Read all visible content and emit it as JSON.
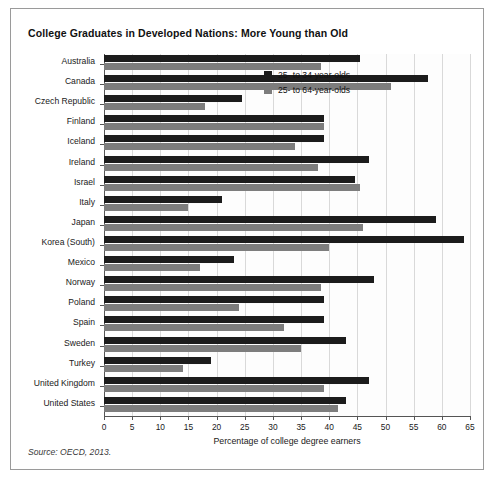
{
  "figure": {
    "source_note": "Source: OECD, 2013.",
    "colors": {
      "young": "#1c1c1c",
      "all": "#7d7d7d",
      "grid": "#d9d9d9",
      "axis": "#555555",
      "frame": "#9a9a9a"
    }
  },
  "chart_data": {
    "type": "bar",
    "orientation": "horizontal",
    "title": "College Graduates in Developed Nations: More Young than Old",
    "xlabel": "Percentage of college degree earners",
    "ylabel": "",
    "xlim": [
      0,
      65
    ],
    "xticks": [
      0,
      5,
      10,
      15,
      20,
      25,
      30,
      35,
      40,
      45,
      50,
      55,
      60,
      65
    ],
    "grid": true,
    "legend_position": "upper right inside",
    "categories": [
      "Australia",
      "Canada",
      "Czech Republic",
      "Finland",
      "Iceland",
      "Ireland",
      "Israel",
      "Italy",
      "Japan",
      "Korea (South)",
      "Mexico",
      "Norway",
      "Poland",
      "Spain",
      "Sweden",
      "Turkey",
      "United Kingdom",
      "United States"
    ],
    "series": [
      {
        "name": "25- to 34-year-olds",
        "color": "#1c1c1c",
        "values": [
          45.5,
          57.5,
          24.5,
          39,
          39,
          47,
          44.5,
          21,
          59,
          64,
          23,
          48,
          39,
          39,
          43,
          19,
          47,
          43
        ]
      },
      {
        "name": "25- to 64-year-olds",
        "color": "#7d7d7d",
        "values": [
          38.5,
          51,
          18,
          39,
          34,
          38,
          45.5,
          15,
          46,
          40,
          17,
          38.5,
          24,
          32,
          35,
          14,
          39,
          41.5
        ]
      }
    ]
  }
}
